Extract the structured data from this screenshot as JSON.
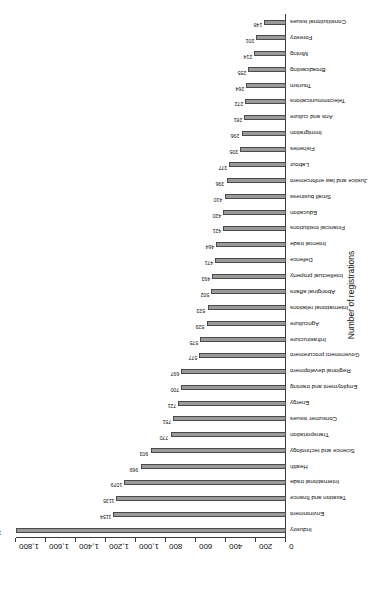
{
  "chart_data": {
    "type": "bar",
    "orientation": "vertical-rotated",
    "title": "",
    "xlabel": "",
    "ylabel": "Number of registrations",
    "ylim": [
      0,
      1800
    ],
    "yticks": [
      "0",
      "200",
      "400",
      "600",
      "800",
      "1,000",
      "1,200",
      "1,400",
      "1,600",
      "1,800"
    ],
    "ytick_values": [
      0,
      200,
      400,
      600,
      800,
      1000,
      1200,
      1400,
      1600,
      1800
    ],
    "grid": false,
    "legend": null,
    "bar_color": "#9a9a9a",
    "bar_edge_color": "#4a4a4a",
    "categories": [
      "Industry",
      "Environment",
      "Taxation and finance",
      "International trade",
      "Health",
      "Science and technology",
      "Transportation",
      "Consumer issues",
      "Energy",
      "Employment and training",
      "Regional development",
      "Government procurement",
      "Infrastructure",
      "Agriculture",
      "International relations",
      "Aboriginal affairs",
      "Intellectual property",
      "Defence",
      "Internal trade",
      "Financial institutions",
      "Education",
      "Small business",
      "Justice and law enforcement",
      "Labour",
      "Fisheries",
      "Immigration",
      "Arts and culture",
      "Telecommunications",
      "Tourism",
      "Broadcasting",
      "Mining",
      "Forestry",
      "Constitutional issues"
    ],
    "values": [
      1887,
      1154,
      1135,
      1079,
      969,
      903,
      770,
      751,
      721,
      700,
      697,
      577,
      575,
      529,
      523,
      502,
      493,
      471,
      464,
      421,
      420,
      410,
      396,
      377,
      305,
      296,
      281,
      272,
      264,
      255,
      214,
      201,
      148
    ]
  }
}
